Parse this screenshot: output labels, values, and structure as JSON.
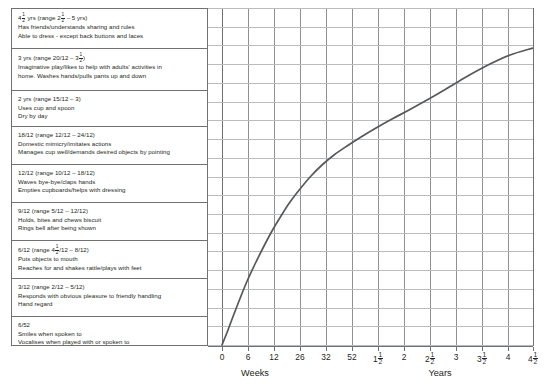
{
  "chart_data": {
    "type": "line",
    "xlabel_left": "Weeks",
    "xlabel_right": "Years",
    "ylabel": "",
    "grid": true,
    "legend": "none",
    "x_ticks": [
      "0",
      "6",
      "12",
      "26",
      "32",
      "52",
      "1½",
      "2",
      "2½",
      "3",
      "3½",
      "4",
      "4½"
    ],
    "x_tick_units": [
      "weeks",
      "weeks",
      "weeks",
      "weeks",
      "weeks",
      "weeks",
      "years",
      "years",
      "years",
      "years",
      "years",
      "years",
      "years"
    ],
    "x_tick_px": [
      222,
      248,
      274,
      300,
      326,
      352,
      378,
      404,
      430,
      456,
      482,
      508,
      533
    ],
    "xlim_labels": [
      "0 weeks",
      "4½ years"
    ],
    "series": [
      {
        "name": "developmental progress",
        "points_px": [
          [
            222,
            345
          ],
          [
            228,
            330
          ],
          [
            234,
            314
          ],
          [
            241,
            296
          ],
          [
            248,
            279
          ],
          [
            256,
            262
          ],
          [
            264,
            246
          ],
          [
            272,
            231
          ],
          [
            281,
            216
          ],
          [
            290,
            202
          ],
          [
            300,
            189
          ],
          [
            311,
            176
          ],
          [
            322,
            165
          ],
          [
            334,
            155
          ],
          [
            347,
            146
          ],
          [
            361,
            137
          ],
          [
            376,
            128
          ],
          [
            392,
            119
          ],
          [
            409,
            110
          ],
          [
            427,
            100
          ],
          [
            446,
            89
          ],
          [
            466,
            77
          ],
          [
            488,
            65
          ],
          [
            510,
            55
          ],
          [
            533,
            48
          ]
        ]
      }
    ],
    "line_color": "#56585a",
    "grid_color": "#b9bcbe",
    "axis_color": "#6f7173"
  },
  "milestones": [
    {
      "id": "age-4h-yrs",
      "head_pre": "4",
      "head_frac": {
        "n": "1",
        "d": "2"
      },
      "head_mid": " yrs (range 2",
      "head_frac2": {
        "n": "1",
        "d": "2"
      },
      "head_post": " – 5 yrs)",
      "lines": [
        "Has friends/understands sharing and rules",
        "Able to dress - except back buttons and laces"
      ]
    },
    {
      "id": "age-3-yrs",
      "head_pre": "3 yrs (range 20/12 – 3",
      "head_frac": {
        "n": "1",
        "d": "2"
      },
      "head_post": ")",
      "lines": [
        "Imaginative play/likes to help with adults' activities in",
        "home. Washes hands/pulls pants up and down"
      ]
    },
    {
      "id": "age-2-yrs",
      "head_pre": "2 yrs (range 15/12 – 3)",
      "head_post": "",
      "lines": [
        "Uses cup and spoon",
        "Dry by day"
      ]
    },
    {
      "id": "age-18-12",
      "head_pre": "18/12 (range 12/12 – 24/12)",
      "head_post": "",
      "lines": [
        "Domestic mimicry/imitates actions",
        "Manages cup well/demands desired objects by pointing"
      ]
    },
    {
      "id": "age-12-12",
      "head_pre": "12/12 (range 10/12 – 18/12)",
      "head_post": "",
      "lines": [
        "Waves bye-bye/claps hands",
        "Empties cupboards/helps with dressing"
      ]
    },
    {
      "id": "age-9-12",
      "head_pre": "9/12 (range 5/12 – 12/12)",
      "head_post": "",
      "lines": [
        "Holds, bites and chews biscuit",
        "Rings bell after being shown"
      ]
    },
    {
      "id": "age-6-12",
      "head_pre": "6/12 (range 4",
      "head_frac": {
        "n": "1",
        "d": "2"
      },
      "head_post": "/12 – 8/12)",
      "lines": [
        "Puts objects to mouth",
        "Reaches for and shakes rattle/plays with feet"
      ]
    },
    {
      "id": "age-3-12",
      "head_pre": "3/12 (range 2/12 – 5/12)",
      "head_post": "",
      "lines": [
        "Responds with obvious pleasure to friendly handling",
        "Hand regard"
      ]
    },
    {
      "id": "age-6-52",
      "head_pre": "6/52",
      "head_post": "",
      "lines": [
        "Smiles when spoken to",
        "Vocalises when played with or spoken to"
      ]
    }
  ],
  "axis": {
    "weeks_label": "Weeks",
    "years_label": "Years"
  }
}
